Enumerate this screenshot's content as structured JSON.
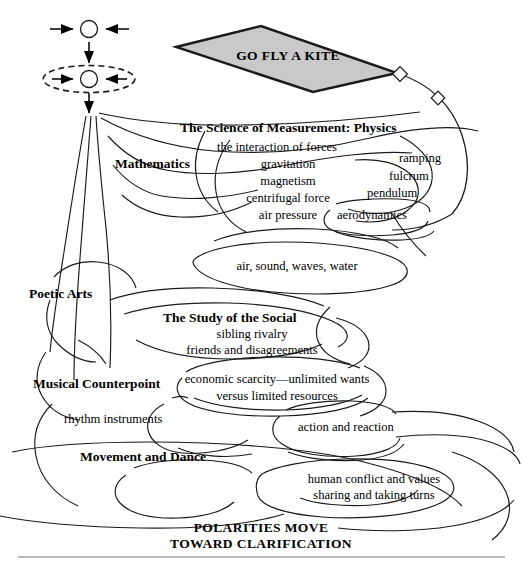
{
  "diagram": {
    "title_banner": {
      "text": "GO FLY A KITE",
      "fill_color": "#c9c9c9",
      "stroke_color": "#1a1a1a"
    },
    "footer": {
      "line1": "POLARITIES MOVE",
      "line2": "TOWARD CLARIFICATION"
    },
    "symbol": {
      "name": "polarity-convergence-symbol",
      "top_circle_label": "",
      "bottom_circle_label": "",
      "description_arrows": "arrows-converging-on-circle"
    },
    "branches": [
      {
        "id": "mathematics",
        "label": "Mathematics",
        "emphasis": "bold"
      },
      {
        "id": "physics",
        "label": "The Science of Measurement: Physics",
        "emphasis": "bold"
      },
      {
        "id": "poetic-arts",
        "label": "Poetic Arts",
        "emphasis": "bold"
      },
      {
        "id": "social",
        "label": "The Study of the Social",
        "emphasis": "bold"
      },
      {
        "id": "musical-counterpoint",
        "label": "Musical Counterpoint",
        "emphasis": "bold"
      },
      {
        "id": "movement-dance",
        "label": "Movement and Dance",
        "emphasis": "bold"
      }
    ],
    "items": [
      {
        "id": "interaction-of-forces",
        "label": "the interaction of forces"
      },
      {
        "id": "gravitation",
        "label": "gravitation"
      },
      {
        "id": "magnetism",
        "label": "magnetism"
      },
      {
        "id": "centrifugal-force",
        "label": "centrifugal force"
      },
      {
        "id": "air-pressure",
        "label": "air pressure"
      },
      {
        "id": "ramping",
        "label": "ramping"
      },
      {
        "id": "fulcrum",
        "label": "fulcrum"
      },
      {
        "id": "pendulum",
        "label": "pendulum"
      },
      {
        "id": "aerodynamics",
        "label": "aerodynamics"
      },
      {
        "id": "air-sound-waves-water",
        "label": "air, sound, waves, water"
      },
      {
        "id": "sibling-rivalry",
        "label": "sibling rivalry"
      },
      {
        "id": "friends-and-disagreements",
        "label": "friends and disagreements"
      },
      {
        "id": "economic-scarcity",
        "label": "economic scarcity—unlimited wants"
      },
      {
        "id": "versus-limited-resources",
        "label": "versus limited resources"
      },
      {
        "id": "rhythm-instruments",
        "label": "rhythm instruments"
      },
      {
        "id": "action-and-reaction",
        "label": "action and reaction"
      },
      {
        "id": "human-conflict-and-values",
        "label": "human conflict and values"
      },
      {
        "id": "sharing-and-taking-turns",
        "label": "sharing and taking turns"
      }
    ]
  }
}
